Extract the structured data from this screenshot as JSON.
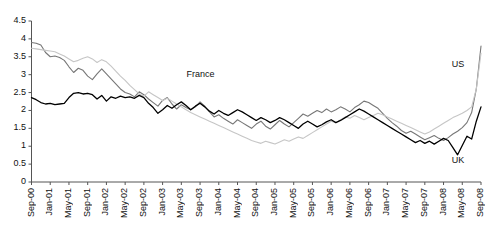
{
  "chart_data": {
    "type": "line",
    "title": "",
    "xlabel": "",
    "ylabel": "",
    "ylim": [
      0,
      4.5
    ],
    "ytick_step": 0.5,
    "yticks": [
      "0",
      "0.5",
      "1",
      "1.5",
      "2",
      "2.5",
      "3",
      "3.5",
      "4",
      "4.5"
    ],
    "grid": false,
    "legend_position": "inline-annotations",
    "x_tick_labels": [
      "Sep-00",
      "Jan-01",
      "May-01",
      "Sep-01",
      "Jan-02",
      "May-02",
      "Sep-02",
      "Jan-03",
      "May-03",
      "Sep-03",
      "Jan-04",
      "May-04",
      "Sep-04",
      "Jan-05",
      "May-05",
      "Sep-05",
      "Jan-06",
      "May-06",
      "Sep-06",
      "Jan-07",
      "May-07",
      "Sep-07",
      "Jan-08",
      "May-08",
      "Sep-08"
    ],
    "x_tick_interval_months": 4,
    "x_start": "Sep-00",
    "x_end": "Sep-08",
    "n_points": 97,
    "annotations": [
      {
        "text": "France",
        "x_frac": 0.345,
        "y_value": 3.02,
        "series": "France"
      },
      {
        "text": "US",
        "x_frac": 0.935,
        "y_value": 3.3,
        "series": "US"
      },
      {
        "text": "UK",
        "x_frac": 0.935,
        "y_value": 0.62,
        "series": "UK"
      }
    ],
    "series": [
      {
        "name": "France",
        "color": "#777777",
        "width": 1.1,
        "values": [
          3.9,
          3.88,
          3.83,
          3.62,
          3.5,
          3.52,
          3.48,
          3.4,
          3.22,
          3.06,
          3.18,
          3.12,
          2.96,
          2.86,
          3.02,
          3.16,
          3.02,
          2.88,
          2.74,
          2.6,
          2.5,
          2.46,
          2.38,
          2.52,
          2.44,
          2.32,
          2.22,
          2.12,
          2.28,
          2.36,
          2.18,
          2.04,
          2.16,
          2.08,
          2.02,
          2.1,
          2.24,
          2.12,
          1.96,
          1.82,
          1.88,
          1.78,
          1.7,
          1.62,
          1.74,
          1.66,
          1.58,
          1.5,
          1.62,
          1.7,
          1.56,
          1.48,
          1.6,
          1.72,
          1.62,
          1.54,
          1.66,
          1.78,
          1.9,
          1.84,
          1.92,
          2.0,
          1.94,
          2.04,
          1.96,
          2.02,
          2.1,
          2.04,
          1.96,
          2.08,
          2.16,
          2.26,
          2.22,
          2.14,
          2.06,
          1.92,
          1.78,
          1.66,
          1.56,
          1.44,
          1.36,
          1.42,
          1.34,
          1.26,
          1.18,
          1.24,
          1.3,
          1.22,
          1.16,
          1.24,
          1.34,
          1.42,
          1.52,
          1.66,
          1.94,
          2.6,
          3.8
        ]
      },
      {
        "name": "US",
        "color": "#c6c6c6",
        "width": 1.1,
        "values": [
          3.74,
          3.72,
          3.7,
          3.68,
          3.66,
          3.64,
          3.58,
          3.52,
          3.44,
          3.36,
          3.4,
          3.46,
          3.5,
          3.44,
          3.34,
          3.42,
          3.36,
          3.24,
          3.1,
          2.96,
          2.84,
          2.7,
          2.58,
          2.46,
          2.4,
          2.52,
          2.44,
          2.36,
          2.28,
          2.34,
          2.26,
          2.18,
          2.1,
          2.02,
          1.94,
          1.88,
          1.82,
          1.76,
          1.7,
          1.64,
          1.58,
          1.52,
          1.46,
          1.4,
          1.34,
          1.28,
          1.22,
          1.16,
          1.12,
          1.08,
          1.14,
          1.1,
          1.06,
          1.12,
          1.18,
          1.14,
          1.2,
          1.26,
          1.22,
          1.3,
          1.38,
          1.46,
          1.54,
          1.62,
          1.7,
          1.66,
          1.74,
          1.82,
          1.78,
          1.86,
          1.8,
          1.74,
          1.8,
          1.86,
          1.92,
          1.88,
          1.82,
          1.76,
          1.7,
          1.64,
          1.58,
          1.52,
          1.46,
          1.4,
          1.34,
          1.4,
          1.48,
          1.56,
          1.64,
          1.72,
          1.8,
          1.86,
          1.92,
          2.0,
          2.1,
          2.6,
          3.6
        ]
      },
      {
        "name": "UK",
        "color": "#000000",
        "width": 1.3,
        "values": [
          2.36,
          2.3,
          2.22,
          2.18,
          2.2,
          2.16,
          2.18,
          2.2,
          2.36,
          2.48,
          2.5,
          2.46,
          2.48,
          2.44,
          2.32,
          2.42,
          2.26,
          2.38,
          2.34,
          2.4,
          2.36,
          2.38,
          2.34,
          2.42,
          2.36,
          2.2,
          2.08,
          1.92,
          2.02,
          2.14,
          2.06,
          2.16,
          2.24,
          2.14,
          2.02,
          2.12,
          2.2,
          2.1,
          1.98,
          1.9,
          2.0,
          1.92,
          1.86,
          1.94,
          2.02,
          1.96,
          1.88,
          1.8,
          1.72,
          1.8,
          1.74,
          1.66,
          1.72,
          1.8,
          1.74,
          1.66,
          1.58,
          1.5,
          1.62,
          1.7,
          1.62,
          1.54,
          1.6,
          1.68,
          1.74,
          1.66,
          1.72,
          1.8,
          1.88,
          1.96,
          2.04,
          1.98,
          1.9,
          1.82,
          1.74,
          1.66,
          1.58,
          1.5,
          1.42,
          1.34,
          1.26,
          1.18,
          1.1,
          1.16,
          1.08,
          1.14,
          1.06,
          1.14,
          1.22,
          1.16,
          0.96,
          0.76,
          1.02,
          1.28,
          1.2,
          1.7,
          2.1
        ]
      }
    ]
  },
  "axis": {
    "tick_color": "#555555",
    "line_color": "#555555"
  }
}
